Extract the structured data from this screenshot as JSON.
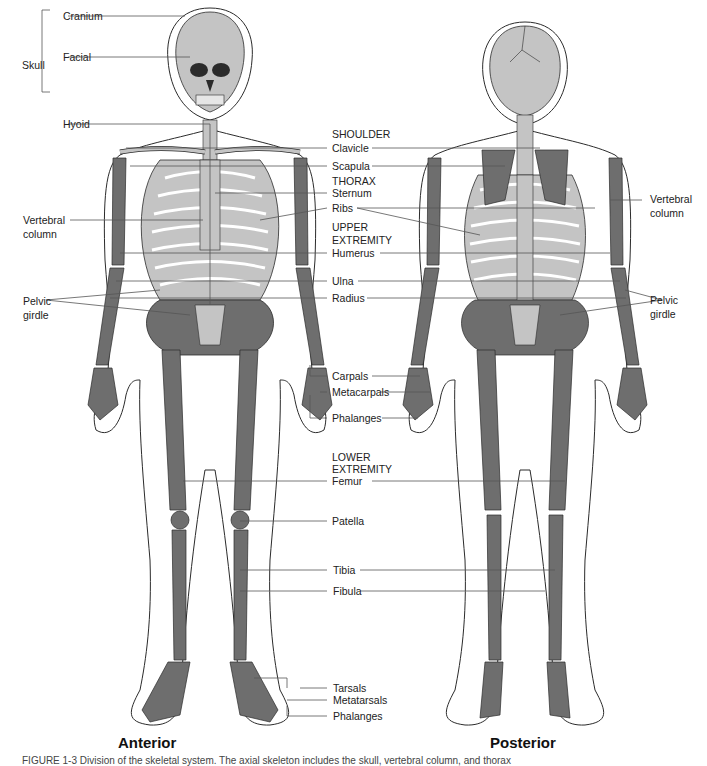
{
  "figure": {
    "views": {
      "anterior": "Anterior",
      "posterior": "Posterior"
    },
    "caption": "FIGURE 1-3 Division of the skeletal system. The axial skeleton includes the skull, vertebral column, and thorax",
    "colors": {
      "axial_bone": "#c4c4c4",
      "appendicular_bone": "#6e6e6e",
      "outline": "#2b2b2b",
      "leader": "#555555"
    }
  },
  "left_labels": {
    "skull_group": "Skull",
    "cranium": "Cranium",
    "facial": "Facial",
    "hyoid": "Hyoid",
    "vertebral_column": [
      "Vertebral",
      "column"
    ],
    "pelvic_girdle": [
      "Pelvic",
      "girdle"
    ]
  },
  "right_labels": {
    "vertebral_column": [
      "Vertebral",
      "column"
    ],
    "pelvic_girdle": [
      "Pelvic",
      "girdle"
    ]
  },
  "center_labels": {
    "shoulder_heading": "SHOULDER",
    "clavicle": "Clavicle",
    "scapula": "Scapula",
    "thorax_heading": "THORAX",
    "sternum": "Sternum",
    "ribs": "Ribs",
    "upper_heading": [
      "UPPER",
      "EXTREMITY"
    ],
    "humerus": "Humerus",
    "ulna": "Ulna",
    "radius": "Radius",
    "carpals": "Carpals",
    "metacarpals": "Metacarpals",
    "phalanges_hand": "Phalanges",
    "lower_heading": [
      "LOWER",
      "EXTREMITY"
    ],
    "femur": "Femur",
    "patella": "Patella",
    "tibia": "Tibia",
    "fibula": "Fibula",
    "tarsals": "Tarsals",
    "metatarsals": "Metatarsals",
    "phalanges_foot": "Phalanges"
  }
}
